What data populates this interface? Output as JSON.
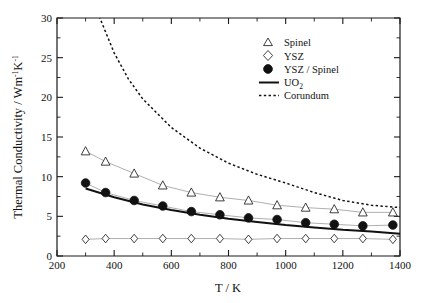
{
  "chart_data": {
    "type": "scatter",
    "title": "",
    "xlabel": "T / K",
    "ylabel": "Thermal Conductivity / Wm⁻¹K⁻¹",
    "xlim": [
      200,
      1400
    ],
    "ylim": [
      0,
      30
    ],
    "xticks": [
      200,
      400,
      600,
      800,
      1000,
      1200,
      1400
    ],
    "yticks": [
      0,
      5,
      10,
      15,
      20,
      25,
      30
    ],
    "xtick_labels": [
      "200",
      "400",
      "600",
      "800",
      "1000",
      "1200",
      "1400"
    ],
    "ytick_labels": [
      "0",
      "5",
      "10",
      "15",
      "20",
      "25",
      "30"
    ],
    "grid": false,
    "legend_position": "top-right",
    "series": [
      {
        "name": "Spinel",
        "marker": "open-triangle",
        "x": [
          300,
          370,
          470,
          570,
          670,
          770,
          870,
          970,
          1070,
          1170,
          1270,
          1375
        ],
        "values": [
          13.2,
          11.9,
          10.4,
          8.9,
          8.0,
          7.4,
          7.0,
          6.4,
          6.1,
          5.9,
          5.5,
          5.5
        ]
      },
      {
        "name": "YSZ",
        "marker": "open-diamond",
        "x": [
          300,
          370,
          470,
          570,
          670,
          770,
          870,
          970,
          1070,
          1170,
          1270,
          1375
        ],
        "values": [
          2.1,
          2.2,
          2.2,
          2.2,
          2.2,
          2.2,
          2.1,
          2.2,
          2.2,
          2.2,
          2.2,
          2.1
        ]
      },
      {
        "name": "YSZ / Spinel",
        "marker": "filled-circle",
        "x": [
          300,
          370,
          470,
          570,
          670,
          770,
          870,
          970,
          1070,
          1170,
          1270,
          1375
        ],
        "values": [
          9.2,
          8.0,
          7.0,
          6.3,
          5.6,
          5.2,
          4.8,
          4.6,
          4.2,
          4.0,
          3.8,
          3.9
        ]
      },
      {
        "name": "UO2",
        "marker": "solid-line",
        "x": [
          300,
          400,
          500,
          600,
          700,
          800,
          900,
          1000,
          1100,
          1200,
          1300,
          1400
        ],
        "values": [
          8.5,
          7.4,
          6.5,
          5.8,
          5.2,
          4.7,
          4.3,
          3.9,
          3.6,
          3.3,
          3.1,
          2.8
        ]
      },
      {
        "name": "Corundum",
        "marker": "dotted-line",
        "x": [
          300,
          350,
          400,
          450,
          500,
          600,
          700,
          800,
          900,
          1000,
          1100,
          1200,
          1300,
          1400
        ],
        "values": [
          36.0,
          30.0,
          25.6,
          22.3,
          19.8,
          16.2,
          13.6,
          11.7,
          10.3,
          9.2,
          8.0,
          7.0,
          6.4,
          6.1
        ]
      }
    ]
  },
  "axes": {
    "x_title": "T / K",
    "y_title_main": "Thermal Conductivity / Wm",
    "y_title_sup1": "-1",
    "y_title_k": "K",
    "y_title_sup2": "-1"
  },
  "legend": {
    "entries": [
      {
        "label": "Spinel",
        "symbol": "open-triangle"
      },
      {
        "label": "YSZ",
        "symbol": "open-diamond"
      },
      {
        "label": "YSZ / Spinel",
        "symbol": "filled-circle"
      },
      {
        "label": "UO",
        "sub": "2",
        "symbol": "solid-line"
      },
      {
        "label": "Corundum",
        "symbol": "dotted-line"
      }
    ]
  }
}
